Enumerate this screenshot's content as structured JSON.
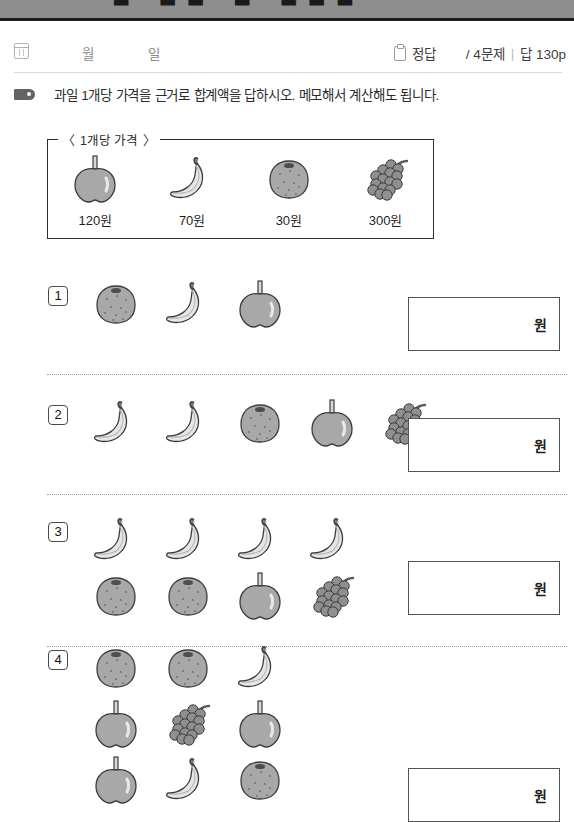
{
  "banner": {
    "ghost_text": "■ ■■  ■  ■■■"
  },
  "meta": {
    "calendar_icon": "calendar-icon",
    "month_label": "월",
    "day_label": "일",
    "clipboard_icon": "clipboard-icon",
    "answer_label": "정답",
    "problem_count": "/ 4문제",
    "separator": "|",
    "answer_page": "답 130p"
  },
  "instruction": {
    "icon": "tag-icon",
    "text": "과일 1개당 가격을 근거로 합계액을 답하시오. 메모해서 계산해도 됩니다."
  },
  "price_panel": {
    "label": "1개당 가격",
    "bracket_left": "〈",
    "bracket_right": "〉",
    "items": [
      {
        "fruit": "apple",
        "price": "120원"
      },
      {
        "fruit": "banana",
        "price": "70원"
      },
      {
        "fruit": "orange",
        "price": "30원"
      },
      {
        "fruit": "grapes",
        "price": "300원"
      }
    ]
  },
  "answer_unit": "원",
  "problems": [
    {
      "number": "1",
      "rows": [
        [
          "orange",
          "banana",
          "apple"
        ]
      ]
    },
    {
      "number": "2",
      "rows": [
        [
          "banana",
          "banana",
          "orange",
          "apple",
          "grapes"
        ]
      ]
    },
    {
      "number": "3",
      "rows": [
        [
          "banana",
          "banana",
          "banana",
          "banana"
        ],
        [
          "orange",
          "orange",
          "apple",
          "grapes"
        ]
      ]
    },
    {
      "number": "4",
      "rows": [
        [
          "orange",
          "orange",
          "banana"
        ],
        [
          "apple",
          "grapes",
          "apple"
        ],
        [
          "apple",
          "banana",
          "orange"
        ]
      ]
    }
  ]
}
